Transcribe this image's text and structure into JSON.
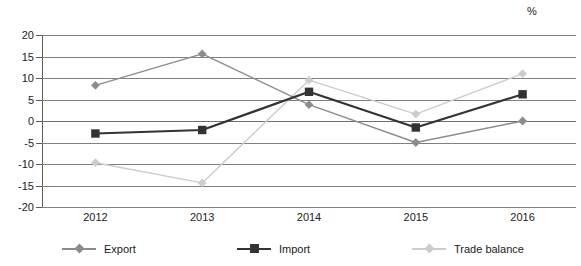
{
  "chart_data": {
    "type": "line",
    "title": "",
    "subtitle": "",
    "unit_label": "%",
    "xlabel": "",
    "ylabel": "",
    "categories": [
      "2012",
      "2013",
      "2014",
      "2015",
      "2016"
    ],
    "x_tick_labels": [
      "2012",
      "2013",
      "2014",
      "2015",
      "2016"
    ],
    "y_tick_labels": [
      "20",
      "15",
      "10",
      "5",
      "0",
      "-5",
      "-10",
      "-15",
      "-20"
    ],
    "y_tick_values": [
      20,
      15,
      10,
      5,
      0,
      -5,
      -10,
      -15,
      -20
    ],
    "ylim": [
      -20,
      20
    ],
    "grid": "horizontal",
    "legend_position": "bottom",
    "series": [
      {
        "name": "Export",
        "color": "#8c8c8c",
        "marker": "diamond",
        "values": [
          8.3,
          15.6,
          3.8,
          -5.0,
          0.0
        ]
      },
      {
        "name": "Import",
        "color": "#333333",
        "marker": "square",
        "values": [
          -2.9,
          -2.1,
          6.8,
          -1.5,
          6.2
        ]
      },
      {
        "name": "Trade balance",
        "color": "#cccccc",
        "marker": "diamond",
        "values": [
          -9.7,
          -14.4,
          9.5,
          1.6,
          11.0
        ]
      }
    ],
    "legend": [
      {
        "label": "Export",
        "color": "#8c8c8c",
        "marker": "diamond"
      },
      {
        "label": "Import",
        "color": "#333333",
        "marker": "square"
      },
      {
        "label": "Trade balance",
        "color": "#cccccc",
        "marker": "diamond"
      }
    ],
    "colors": {
      "export": "#8c8c8c",
      "import": "#333333",
      "trade_balance": "#cccccc",
      "grid": "#808080",
      "axis": "#5a5a5a",
      "text": "#1a1a1a",
      "background": "#ffffff"
    }
  }
}
